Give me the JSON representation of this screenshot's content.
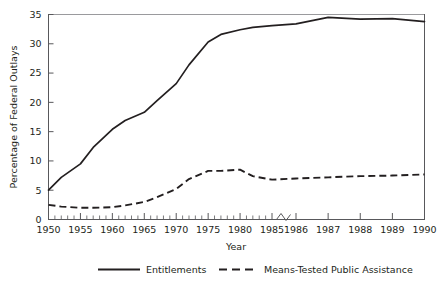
{
  "chart_data": {
    "type": "line",
    "title": "",
    "xlabel": "Year",
    "ylabel": "Percentage of Federal Outlays",
    "ylim": [
      0,
      35
    ],
    "yticks": [
      0,
      5,
      10,
      15,
      20,
      25,
      30,
      35
    ],
    "ytick_labels": [
      "0",
      "5",
      "10",
      "15",
      "20",
      "25",
      "30",
      "35"
    ],
    "xtick_labels": [
      "1950",
      "1955",
      "1960",
      "1965",
      "1970",
      "1975",
      "1980",
      "1985",
      "1986",
      "1987",
      "1988",
      "1989",
      "1990"
    ],
    "x": [
      1950,
      1955,
      1960,
      1965,
      1970,
      1975,
      1980,
      1985,
      1986,
      1987,
      1988,
      1989,
      1990
    ],
    "grid": false,
    "axis_break": {
      "present": true,
      "between": [
        "1985",
        "1986"
      ],
      "note": "x-axis scale changes from 5-year intervals to 1-year intervals"
    },
    "minor_ticks": "every year from 1950 to 1985",
    "legend_position": "below",
    "series": [
      {
        "name": "Entitlements",
        "style": "solid",
        "color": "#231f20",
        "x": [
          1950,
          1952,
          1955,
          1957,
          1960,
          1962,
          1965,
          1967,
          1970,
          1972,
          1975,
          1977,
          1980,
          1982,
          1985,
          1986,
          1987,
          1988,
          1989,
          1990
        ],
        "values": [
          5.0,
          7.2,
          9.5,
          12.3,
          15.4,
          16.9,
          18.3,
          20.3,
          23.2,
          26.4,
          30.3,
          31.6,
          32.4,
          32.8,
          33.1,
          33.4,
          34.5,
          34.2,
          34.3,
          33.8
        ]
      },
      {
        "name": "Means-Tested Public Assistance",
        "style": "dashed",
        "color": "#231f20",
        "x": [
          1950,
          1952,
          1955,
          1957,
          1960,
          1962,
          1965,
          1967,
          1970,
          1972,
          1975,
          1977,
          1980,
          1982,
          1985,
          1986,
          1987,
          1988,
          1989,
          1990
        ],
        "values": [
          2.5,
          2.2,
          2.0,
          2.0,
          2.1,
          2.4,
          3.0,
          3.8,
          5.2,
          6.9,
          8.3,
          8.3,
          8.5,
          7.4,
          6.8,
          7.0,
          7.2,
          7.4,
          7.5,
          7.7
        ]
      }
    ]
  },
  "legend": {
    "entries": [
      {
        "label": "Entitlements",
        "style": "solid"
      },
      {
        "label": "Means-Tested Public Assistance",
        "style": "dashed"
      }
    ]
  }
}
